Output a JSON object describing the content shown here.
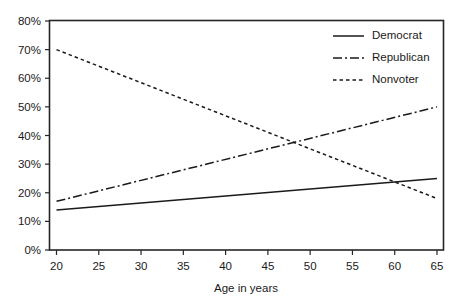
{
  "figure": {
    "background_color": "#ffffff",
    "ink_color": "#1a1a1a"
  },
  "axes": {
    "x_title": "Age in years",
    "y_title": "",
    "x_tick_labels": [
      "20",
      "25",
      "30",
      "35",
      "40",
      "45",
      "50",
      "55",
      "60",
      "65"
    ],
    "y_tick_labels": [
      "0%",
      "10%",
      "20%",
      "30%",
      "40%",
      "50%",
      "60%",
      "70%",
      "80%"
    ]
  },
  "legend": {
    "entries": [
      {
        "label": "Democrat",
        "dash": "solid"
      },
      {
        "label": "Republican",
        "dash": "dashdot"
      },
      {
        "label": "Nonvoter",
        "dash": "dotted"
      }
    ]
  },
  "caption": {
    "text": ""
  },
  "chart_data": {
    "type": "line",
    "title": "",
    "subtitle": "",
    "xlabel": "Age in years",
    "ylabel": "",
    "xlim": [
      20,
      65
    ],
    "ylim": [
      0,
      80
    ],
    "x_ticks": [
      20,
      25,
      30,
      35,
      40,
      45,
      50,
      55,
      60,
      65
    ],
    "y_ticks": [
      0,
      10,
      20,
      30,
      40,
      50,
      60,
      70,
      80
    ],
    "y_tick_format": "percent",
    "grid": false,
    "legend_position": "top-right inside plot area",
    "x": [
      20,
      65
    ],
    "series": [
      {
        "name": "Democrat",
        "dash": "solid",
        "color": "#1a1a1a",
        "values": [
          14,
          25
        ]
      },
      {
        "name": "Republican",
        "dash": "dashdot",
        "color": "#1a1a1a",
        "values": [
          17,
          50
        ]
      },
      {
        "name": "Nonvoter",
        "dash": "dotted",
        "color": "#1a1a1a",
        "values": [
          70,
          18
        ]
      }
    ],
    "annotations": [
      {
        "text": "Republican and Nonvoter lines cross",
        "x": 49,
        "y": 35
      },
      {
        "text": "Democrat and Nonvoter lines cross",
        "x": 61,
        "y": 23
      }
    ]
  }
}
